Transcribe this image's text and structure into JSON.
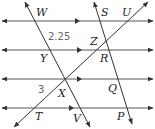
{
  "figure": {
    "parallel_lines": [
      {
        "id": "line-1",
        "y": 21,
        "x1": 2,
        "x2": 153,
        "mid_arrow_x": 80
      },
      {
        "id": "line-2",
        "y": 50,
        "x1": 2,
        "x2": 153,
        "mid_arrow_x": 82
      },
      {
        "id": "line-3",
        "y": 79,
        "x1": 2,
        "x2": 153,
        "mid_arrow_x": 82
      },
      {
        "id": "line-4",
        "y": 108,
        "x1": 2,
        "x2": 153,
        "mid_arrow_x": 74
      }
    ],
    "transversals": [
      {
        "id": "WV",
        "x1": 25,
        "y1": 2,
        "x2": 90,
        "y2": 127
      },
      {
        "id": "SP",
        "x1": 94,
        "y1": 2,
        "x2": 132,
        "y2": 124
      },
      {
        "id": "TU",
        "x1": 14,
        "y1": 127,
        "x2": 148,
        "y2": 2
      }
    ],
    "labels": [
      {
        "text": "W",
        "x": 36,
        "y": 16,
        "type": "point"
      },
      {
        "text": "S",
        "x": 101,
        "y": 16,
        "type": "point"
      },
      {
        "text": "U",
        "x": 122,
        "y": 16,
        "type": "point"
      },
      {
        "text": "2.25",
        "x": 48,
        "y": 40,
        "type": "length"
      },
      {
        "text": "Z",
        "x": 90,
        "y": 45,
        "type": "point"
      },
      {
        "text": "Y",
        "x": 40,
        "y": 62,
        "type": "point"
      },
      {
        "text": "R",
        "x": 100,
        "y": 62,
        "type": "point"
      },
      {
        "text": "3",
        "x": 38,
        "y": 93,
        "type": "length"
      },
      {
        "text": "X",
        "x": 58,
        "y": 97,
        "type": "point"
      },
      {
        "text": "Q",
        "x": 108,
        "y": 92,
        "type": "point"
      },
      {
        "text": "T",
        "x": 35,
        "y": 120,
        "type": "point"
      },
      {
        "text": "V",
        "x": 73,
        "y": 122,
        "type": "point"
      },
      {
        "text": "P",
        "x": 117,
        "y": 120,
        "type": "point"
      }
    ],
    "colors": {
      "line": "#333333",
      "text": "#222222",
      "number": "#666666",
      "background": "#ffffff"
    }
  }
}
